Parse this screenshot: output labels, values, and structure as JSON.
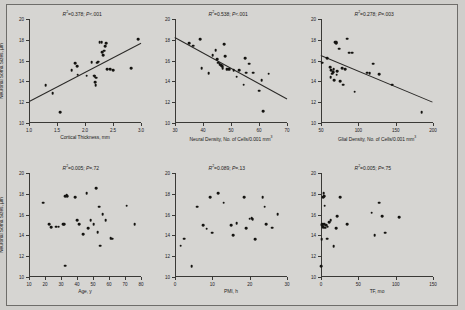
{
  "figure": {
    "background_color": "#d6d5d2",
    "marker_color": "#141310",
    "line_color": "#2a2927"
  },
  "chart_data": [
    {
      "type": "scatter",
      "panel_id": "panel-cortical-thickness",
      "title": "",
      "xlabel": "Cortical Thickness, mm",
      "ylabel": "Neuronal Soma Sizes, µm",
      "xlim": [
        1.0,
        3.0
      ],
      "ylim": [
        10,
        20
      ],
      "xticks": [
        "1.0",
        "1.5",
        "2.0",
        "2.5",
        "3.0"
      ],
      "xtick_values": [
        1.0,
        1.5,
        2.0,
        2.5,
        3.0
      ],
      "yticks": [
        "10",
        "12",
        "14",
        "16",
        "18",
        "20"
      ],
      "ytick_values": [
        10,
        12,
        14,
        16,
        18,
        20
      ],
      "grid": false,
      "annotation": "R²=0.378; P<.001",
      "r_squared": 0.378,
      "p_value": "<.001",
      "regression_line": {
        "x1": 1.0,
        "y1": 12.1,
        "x2": 3.0,
        "y2": 17.7
      },
      "points": [
        [
          1.3,
          13.65
        ],
        [
          1.42,
          12.85
        ],
        [
          1.56,
          11.05
        ],
        [
          1.76,
          15.05
        ],
        [
          1.83,
          15.75
        ],
        [
          1.86,
          15.45
        ],
        [
          1.87,
          14.65
        ],
        [
          2.03,
          14.55
        ],
        [
          2.12,
          15.85
        ],
        [
          2.16,
          14.55
        ],
        [
          2.17,
          14.5
        ],
        [
          2.18,
          13.95
        ],
        [
          2.19,
          13.65
        ],
        [
          2.2,
          14.35
        ],
        [
          2.22,
          15.8
        ],
        [
          2.24,
          15.9
        ],
        [
          2.26,
          17.75
        ],
        [
          2.3,
          17.8
        ],
        [
          2.31,
          16.8
        ],
        [
          2.33,
          16.55
        ],
        [
          2.34,
          16.95
        ],
        [
          2.36,
          17.4
        ],
        [
          2.38,
          17.65
        ],
        [
          2.4,
          15.15
        ],
        [
          2.45,
          15.15
        ],
        [
          2.5,
          15.1
        ],
        [
          2.82,
          15.25
        ],
        [
          2.95,
          18.05
        ]
      ]
    },
    {
      "type": "scatter",
      "panel_id": "panel-neural-density",
      "title": "",
      "xlabel": "Neural Density, No. of Cells/0.001 mm³",
      "ylabel": "",
      "xlim": [
        30,
        70
      ],
      "ylim": [
        10,
        20
      ],
      "xticks": [
        "30",
        "40",
        "50",
        "60",
        "70"
      ],
      "xtick_values": [
        30,
        40,
        50,
        60,
        70
      ],
      "yticks": [
        "10",
        "12",
        "14",
        "16",
        "18",
        "20"
      ],
      "ytick_values": [
        10,
        12,
        14,
        16,
        18,
        20
      ],
      "grid": false,
      "annotation": "R²=0.538; P<.001",
      "r_squared": 0.538,
      "p_value": "<.001",
      "regression_line": {
        "x1": 30,
        "y1": 18.25,
        "x2": 70,
        "y2": 12.35
      },
      "points": [
        [
          35.0,
          17.65
        ],
        [
          36.5,
          17.45
        ],
        [
          39.0,
          18.05
        ],
        [
          39.5,
          15.25
        ],
        [
          42.0,
          14.8
        ],
        [
          43.5,
          16.55
        ],
        [
          44.5,
          17.0
        ],
        [
          45.0,
          16.15
        ],
        [
          45.5,
          15.8
        ],
        [
          46.0,
          15.65
        ],
        [
          46.5,
          15.55
        ],
        [
          46.8,
          15.45
        ],
        [
          47.0,
          15.3
        ],
        [
          47.5,
          17.6
        ],
        [
          48.0,
          16.4
        ],
        [
          48.5,
          15.2
        ],
        [
          49.0,
          15.2
        ],
        [
          49.5,
          15.15
        ],
        [
          51.0,
          15.1
        ],
        [
          52.0,
          14.45
        ],
        [
          53.0,
          15.05
        ],
        [
          54.5,
          13.7
        ],
        [
          55.0,
          16.25
        ],
        [
          55.5,
          14.85
        ],
        [
          56.5,
          15.7
        ],
        [
          58.0,
          14.85
        ],
        [
          60.0,
          13.1
        ],
        [
          61.0,
          14.1
        ],
        [
          61.5,
          11.15
        ],
        [
          63.5,
          14.75
        ]
      ]
    },
    {
      "type": "scatter",
      "panel_id": "panel-glial-density",
      "title": "",
      "xlabel": "Glial Density, No. of Cells/0.001 mm³",
      "ylabel": "",
      "xlim": [
        50,
        200
      ],
      "ylim": [
        10,
        20
      ],
      "xticks": [
        "50",
        "100",
        "150",
        "200"
      ],
      "xtick_values": [
        50,
        100,
        150,
        200
      ],
      "yticks": [
        "10",
        "12",
        "14",
        "16",
        "18",
        "20"
      ],
      "ytick_values": [
        10,
        12,
        14,
        16,
        18,
        20
      ],
      "grid": false,
      "annotation": "R²=0.278; P=.003",
      "r_squared": 0.278,
      "p_value": "=.003",
      "regression_line": {
        "x1": 50,
        "y1": 16.55,
        "x2": 200,
        "y2": 12.05
      },
      "points": [
        [
          52.0,
          15.8
        ],
        [
          58.0,
          16.25
        ],
        [
          62.0,
          15.35
        ],
        [
          63.0,
          14.4
        ],
        [
          64.0,
          15.05
        ],
        [
          65.0,
          14.75
        ],
        [
          66.0,
          14.9
        ],
        [
          67.0,
          15.2
        ],
        [
          68.0,
          14.1
        ],
        [
          69.0,
          17.75
        ],
        [
          70.0,
          17.8
        ],
        [
          70.5,
          17.7
        ],
        [
          71.0,
          14.65
        ],
        [
          72.0,
          15.0
        ],
        [
          74.0,
          17.15
        ],
        [
          76.0,
          14.05
        ],
        [
          78.0,
          15.25
        ],
        [
          80.0,
          13.7
        ],
        [
          82.0,
          15.15
        ],
        [
          85.0,
          18.1
        ],
        [
          88.0,
          16.75
        ],
        [
          92.0,
          16.75
        ],
        [
          95.0,
          13.0
        ],
        [
          112.0,
          14.85
        ],
        [
          115.0,
          14.8
        ],
        [
          120.0,
          15.7
        ],
        [
          128.0,
          14.7
        ],
        [
          145.0,
          13.7
        ],
        [
          185.0,
          11.05
        ]
      ]
    },
    {
      "type": "scatter",
      "panel_id": "panel-age",
      "title": "",
      "xlabel": "Age, y",
      "ylabel": "Neuronal Soma Sizes, µm",
      "xlim": [
        10,
        80
      ],
      "ylim": [
        10,
        20
      ],
      "xticks": [
        "10",
        "20",
        "30",
        "40",
        "50",
        "60",
        "70",
        "80"
      ],
      "xtick_values": [
        10,
        20,
        30,
        40,
        50,
        60,
        70,
        80
      ],
      "yticks": [
        "10",
        "12",
        "14",
        "16",
        "18",
        "20"
      ],
      "ytick_values": [
        10,
        12,
        14,
        16,
        18,
        20
      ],
      "grid": false,
      "annotation": "R²=0.005; P=.72",
      "r_squared": 0.005,
      "p_value": "=.72",
      "regression_line": null,
      "points": [
        [
          19.0,
          17.15
        ],
        [
          22.5,
          15.05
        ],
        [
          24.0,
          14.8
        ],
        [
          27.0,
          14.85
        ],
        [
          28.5,
          14.85
        ],
        [
          31.5,
          15.05
        ],
        [
          32.0,
          15.05
        ],
        [
          32.5,
          17.8
        ],
        [
          32.8,
          11.1
        ],
        [
          33.5,
          17.85
        ],
        [
          34.0,
          17.8
        ],
        [
          39.0,
          17.7
        ],
        [
          40.0,
          15.45
        ],
        [
          41.5,
          15.05
        ],
        [
          44.0,
          14.1
        ],
        [
          46.0,
          18.05
        ],
        [
          47.0,
          14.7
        ],
        [
          48.5,
          15.45
        ],
        [
          50.5,
          15.05
        ],
        [
          52.0,
          18.55
        ],
        [
          53.0,
          14.3
        ],
        [
          54.0,
          16.75
        ],
        [
          54.5,
          13.0
        ],
        [
          56.0,
          16.05
        ],
        [
          58.0,
          15.45
        ],
        [
          61.0,
          13.75
        ],
        [
          62.0,
          13.7
        ],
        [
          71.0,
          16.85
        ],
        [
          76.0,
          15.05
        ]
      ]
    },
    {
      "type": "scatter",
      "panel_id": "panel-pmi",
      "title": "",
      "xlabel": "PMI, h",
      "ylabel": "",
      "xlim": [
        0,
        30
      ],
      "ylim": [
        10,
        20
      ],
      "xticks": [
        "0",
        "10",
        "20",
        "30"
      ],
      "xtick_values": [
        0,
        10,
        20,
        30
      ],
      "yticks": [
        "10",
        "12",
        "14",
        "16",
        "18",
        "20"
      ],
      "ytick_values": [
        10,
        12,
        14,
        16,
        18,
        20
      ],
      "grid": false,
      "annotation": "R²=0.089; P=.13",
      "r_squared": 0.089,
      "p_value": "=.13",
      "regression_line": null,
      "points": [
        [
          1.5,
          13.0
        ],
        [
          2.5,
          13.7
        ],
        [
          4.5,
          11.05
        ],
        [
          6.0,
          16.75
        ],
        [
          7.5,
          15.0
        ],
        [
          8.5,
          14.65
        ],
        [
          9.5,
          17.7
        ],
        [
          10.0,
          14.25
        ],
        [
          11.5,
          18.05
        ],
        [
          13.0,
          17.15
        ],
        [
          15.0,
          15.0
        ],
        [
          15.5,
          14.05
        ],
        [
          16.5,
          15.2
        ],
        [
          18.5,
          17.7
        ],
        [
          19.0,
          14.7
        ],
        [
          20.0,
          15.6
        ],
        [
          20.5,
          15.65
        ],
        [
          20.8,
          15.55
        ],
        [
          21.5,
          13.65
        ],
        [
          23.5,
          17.65
        ],
        [
          24.0,
          16.75
        ],
        [
          24.5,
          15.05
        ],
        [
          26.0,
          14.75
        ],
        [
          27.5,
          16.05
        ]
      ]
    },
    {
      "type": "scatter",
      "panel_id": "panel-tf",
      "title": "",
      "xlabel": "TF, mo",
      "ylabel": "",
      "xlim": [
        0,
        150
      ],
      "ylim": [
        10,
        20
      ],
      "xticks": [
        "0",
        "50",
        "100",
        "150"
      ],
      "xtick_values": [
        0,
        50,
        100,
        150
      ],
      "yticks": [
        "10",
        "12",
        "14",
        "16",
        "18",
        "20"
      ],
      "ytick_values": [
        10,
        12,
        14,
        16,
        18,
        20
      ],
      "grid": false,
      "annotation": "R²=0.005; P=.75",
      "r_squared": 0.005,
      "p_value": "=.75",
      "regression_line": null,
      "points": [
        [
          0.5,
          11.05
        ],
        [
          1.0,
          13.65
        ],
        [
          1.5,
          15.05
        ],
        [
          2.0,
          15.0
        ],
        [
          2.5,
          14.8
        ],
        [
          3.0,
          17.7
        ],
        [
          3.5,
          18.05
        ],
        [
          4.0,
          17.8
        ],
        [
          4.5,
          15.05
        ],
        [
          5.0,
          16.85
        ],
        [
          6.0,
          14.75
        ],
        [
          7.0,
          15.0
        ],
        [
          8.0,
          13.7
        ],
        [
          9.0,
          14.85
        ],
        [
          11.0,
          15.25
        ],
        [
          13.0,
          15.45
        ],
        [
          17.0,
          12.95
        ],
        [
          20.0,
          14.7
        ],
        [
          22.0,
          15.85
        ],
        [
          26.0,
          17.7
        ],
        [
          35.0,
          15.1
        ],
        [
          68.0,
          16.2
        ],
        [
          72.0,
          14.05
        ],
        [
          78.0,
          17.15
        ],
        [
          82.0,
          15.85
        ],
        [
          86.0,
          14.25
        ],
        [
          105.0,
          15.75
        ]
      ]
    }
  ]
}
